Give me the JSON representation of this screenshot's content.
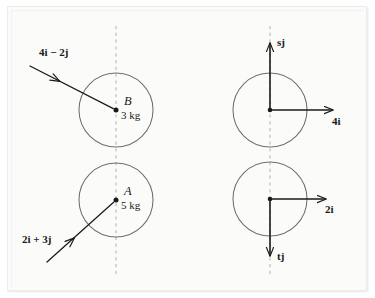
{
  "figure": {
    "background_color": "#fbfbfa",
    "page_color": "#ffffff",
    "ink_color": "#1a1a1a",
    "circle_stroke_color": "#6e6e6e",
    "dashed_line_color": "#b9b9b9"
  },
  "left_panel": {
    "name": "before-collision-panel",
    "dashed_axis_label": "line of centres",
    "bodies": [
      {
        "id": "body-b",
        "name": "B",
        "mass": "3 kg",
        "cx": 116,
        "cy": 110,
        "r": 37,
        "velocity_label": "4i − 2j",
        "velocity_i": "4i",
        "velocity_sign": "−",
        "velocity_j": "2j"
      },
      {
        "id": "body-a",
        "name": "A",
        "mass": "5 kg",
        "cx": 116,
        "cy": 200,
        "r": 37,
        "velocity_label": "2i + 3j",
        "velocity_i": "2i",
        "velocity_sign": "+",
        "velocity_j": "3j"
      }
    ]
  },
  "right_panel": {
    "name": "impulse-panel",
    "bodies": [
      {
        "id": "impulse-upper",
        "cx": 270,
        "cy": 110,
        "r": 37,
        "vertical_label": "sj",
        "vertical_symbol": "s",
        "vertical_unit": "j",
        "vertical_direction": "up",
        "horizontal_label": "4i",
        "horizontal_symbol": "4",
        "horizontal_unit": "i",
        "horizontal_direction": "right"
      },
      {
        "id": "impulse-lower",
        "cx": 270,
        "cy": 199,
        "r": 37,
        "vertical_label": "tj",
        "vertical_symbol": "t",
        "vertical_unit": "j",
        "vertical_direction": "down",
        "horizontal_label": "2i",
        "horizontal_symbol": "2",
        "horizontal_unit": "i",
        "horizontal_direction": "right"
      }
    ]
  }
}
